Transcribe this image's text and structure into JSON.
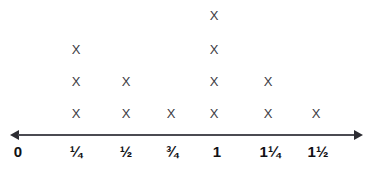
{
  "chart_data": {
    "type": "dot-plot",
    "title": "",
    "xlabel": "",
    "ylabel": "",
    "marker": "X",
    "marker_color": "#3b3b42",
    "axis_color": "#4b4b52",
    "label_color": "#111114",
    "background": "#ffffff",
    "grid": false,
    "legend": null,
    "axis": {
      "arrow_left": true,
      "arrow_right": true,
      "line_y": 135,
      "x_start": 10,
      "x_end": 363
    },
    "categories": [
      "0",
      "¼",
      "½",
      "¾",
      "1",
      "1¼",
      "1½"
    ],
    "values": [
      0,
      3,
      2,
      1,
      4,
      2,
      1
    ],
    "tick_positions": [
      18,
      76,
      126,
      172,
      217,
      270,
      318
    ],
    "column_x": [
      18,
      76,
      126,
      171,
      214,
      268,
      316
    ],
    "row_y": [
      16,
      50,
      82,
      114
    ],
    "points": [
      {
        "category": "¼",
        "x": 76,
        "y": 50,
        "mark": "X"
      },
      {
        "category": "¼",
        "x": 76,
        "y": 82,
        "mark": "X"
      },
      {
        "category": "¼",
        "x": 76,
        "y": 114,
        "mark": "X"
      },
      {
        "category": "½",
        "x": 126,
        "y": 82,
        "mark": "X"
      },
      {
        "category": "½",
        "x": 126,
        "y": 114,
        "mark": "X"
      },
      {
        "category": "¾",
        "x": 171,
        "y": 114,
        "mark": "X"
      },
      {
        "category": "1",
        "x": 214,
        "y": 16,
        "mark": "X"
      },
      {
        "category": "1",
        "x": 214,
        "y": 50,
        "mark": "X"
      },
      {
        "category": "1",
        "x": 214,
        "y": 82,
        "mark": "X"
      },
      {
        "category": "1",
        "x": 214,
        "y": 114,
        "mark": "X"
      },
      {
        "category": "1¼",
        "x": 268,
        "y": 82,
        "mark": "X"
      },
      {
        "category": "1¼",
        "x": 268,
        "y": 114,
        "mark": "X"
      },
      {
        "category": "1½",
        "x": 316,
        "y": 114,
        "mark": "X"
      }
    ],
    "ticks": [
      {
        "label": "0",
        "value": 0,
        "x": 18
      },
      {
        "label": "¼",
        "value": 0.25,
        "x": 76
      },
      {
        "label": "½",
        "value": 0.5,
        "x": 126
      },
      {
        "label": "¾",
        "value": 0.75,
        "x": 172
      },
      {
        "label": "1",
        "value": 1,
        "x": 217
      },
      {
        "label": "1¼",
        "value": 1.25,
        "x": 270
      },
      {
        "label": "1½",
        "value": 1.5,
        "x": 318
      }
    ]
  }
}
